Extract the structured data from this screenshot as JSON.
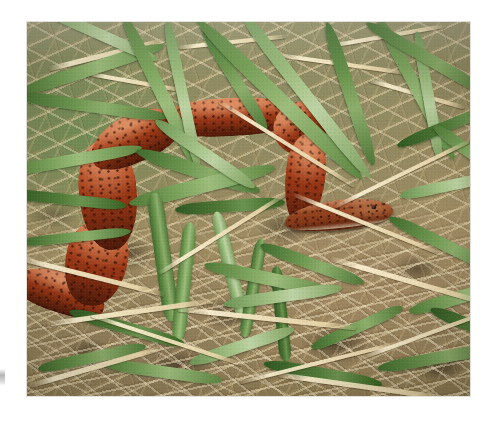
{
  "page": {
    "background_color": "#ffffff",
    "width": 488,
    "height": 423
  },
  "photo": {
    "name": "snake-photograph",
    "alt": "Close-up color photograph of a small reddish-brown snake coiled on the ground among green grass blades and dry tan pine straw",
    "subject": "red-brown snake",
    "habitat": "grass and pine straw ground litter",
    "frame": {
      "x": 27,
      "y": 22,
      "width": 443,
      "height": 374
    },
    "colors": {
      "snake_body": "#a8401a",
      "snake_body_highlight": "#c4521f",
      "snake_body_shadow": "#62210c",
      "snake_speckles": "#32100 6",
      "grass_green": "#6e9750",
      "grass_light_green": "#a3c184",
      "grass_dark_green": "#2f5722",
      "dry_straw_light": "#f0e4c4",
      "dry_straw_mid": "#c6ac7c",
      "soil_brown": "#8a7951",
      "shadow": "#1e160a"
    }
  },
  "artifacts": {
    "edge_smudge": {
      "name": "page-edge-smudge",
      "color": "#8c8c8c",
      "x": 0,
      "y": 369,
      "width": 5,
      "height": 17
    }
  }
}
